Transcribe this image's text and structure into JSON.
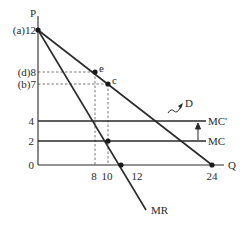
{
  "diagram": {
    "axes": {
      "y_label": "P",
      "x_label": "Q"
    },
    "y_ticks": [
      {
        "value": 12,
        "label": "(a)12",
        "y": 30
      },
      {
        "value": 8,
        "label": "(d)8",
        "y": 72
      },
      {
        "value": 7,
        "label": "(b)7",
        "y": 84
      },
      {
        "value": 4,
        "label": "4",
        "y": 121
      },
      {
        "value": 2,
        "label": "2",
        "y": 141
      },
      {
        "value": 0,
        "label": "0",
        "y": 165
      }
    ],
    "x_ticks": [
      {
        "value": 8,
        "label": "8",
        "x": 95
      },
      {
        "value": 10,
        "label": "10",
        "x": 108
      },
      {
        "value": 12,
        "label": "12",
        "x": 125
      },
      {
        "value": 24,
        "label": "24",
        "x": 212
      }
    ],
    "points": {
      "e": {
        "label": "e",
        "q": 8,
        "p": 8
      },
      "c": {
        "label": "c",
        "q": 10,
        "p": 7
      }
    },
    "curves": {
      "demand": {
        "label": "D"
      },
      "marginal_revenue": {
        "label": "MR"
      },
      "marginal_cost": {
        "label": "MC",
        "value": 2
      },
      "marginal_cost_shifted": {
        "label": "MC'",
        "value": 4
      }
    },
    "colors": {
      "line": "#2a2a2a",
      "dashed": "#555555",
      "background": "#ffffff"
    }
  }
}
